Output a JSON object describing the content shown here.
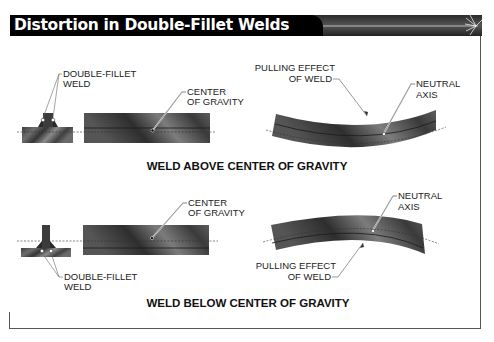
{
  "title": "Distortion in Double-Fillet Welds",
  "colors": {
    "title_bg": "#000000",
    "title_text": "#ffffff",
    "metal_dark": "#3a3a3a",
    "metal_light": "#8a8a8a",
    "frame": "#555555"
  },
  "top_panel": {
    "caption": "WELD ABOVE CENTER OF GRAVITY",
    "weld_label_line1": "DOUBLE-FILLET",
    "weld_label_line2": "WELD",
    "cog_label_line1": "CENTER",
    "cog_label_line2": "OF GRAVITY",
    "pull_label_line1": "PULLING EFFECT",
    "pull_label_line2": "OF WELD",
    "axis_label_line1": "NEUTRAL",
    "axis_label_line2": "AXIS"
  },
  "bottom_panel": {
    "caption": "WELD BELOW CENTER OF GRAVITY",
    "weld_label_line1": "DOUBLE-FILLET",
    "weld_label_line2": "WELD",
    "cog_label_line1": "CENTER",
    "cog_label_line2": "OF GRAVITY",
    "pull_label_line1": "PULLING EFFECT",
    "pull_label_line2": "OF WELD",
    "axis_label_line1": "NEUTRAL",
    "axis_label_line2": "AXIS"
  }
}
